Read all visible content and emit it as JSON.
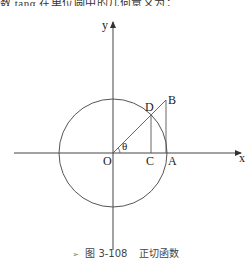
{
  "top_text": "数 tanα 在单位圆中的几何意义为：",
  "figure": {
    "labels": {
      "y_axis": "y",
      "x_axis": "x",
      "origin": "O",
      "point_a": "A",
      "point_b": "B",
      "point_c": "C",
      "point_d": "D",
      "angle": "θ"
    },
    "stroke_color": "#333333"
  },
  "caption": {
    "bullet": "➢",
    "figure_number": "图 3-108",
    "title": "正切函数"
  }
}
